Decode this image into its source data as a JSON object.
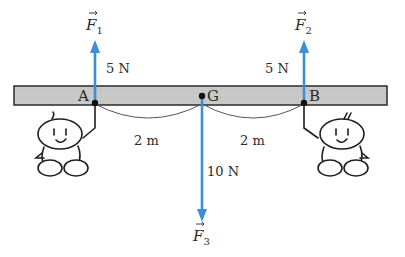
{
  "diagram": {
    "title": "",
    "colors": {
      "arrow": "#3a8fd6",
      "beam_fill": "#c8c8c6",
      "beam_stroke": "#2a2a2a",
      "ink": "#1e1e1e"
    },
    "points": [
      {
        "id": "A",
        "label": "A"
      },
      {
        "id": "G",
        "label": "G"
      },
      {
        "id": "B",
        "label": "B"
      }
    ],
    "forces": [
      {
        "id": "F1",
        "symbol": "F",
        "subscript": "1",
        "magnitude": "5 N",
        "direction": "up",
        "applied_at": "A"
      },
      {
        "id": "F2",
        "symbol": "F",
        "subscript": "2",
        "magnitude": "5 N",
        "direction": "up",
        "applied_at": "B"
      },
      {
        "id": "F3",
        "symbol": "F",
        "subscript": "3",
        "magnitude": "10 N",
        "direction": "down",
        "applied_at": "G"
      }
    ],
    "distances": [
      {
        "from": "A",
        "to": "G",
        "label": "2 m"
      },
      {
        "from": "G",
        "to": "B",
        "label": "2 m"
      }
    ],
    "figures": [
      {
        "id": "left-person",
        "holds": "A"
      },
      {
        "id": "right-person",
        "holds": "B"
      }
    ]
  }
}
